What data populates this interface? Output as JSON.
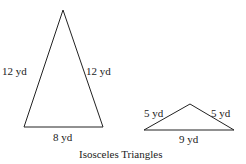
{
  "caption": "Isosceles Triangles",
  "triangles": [
    {
      "name": "tall-triangle",
      "left_side": "12 yd",
      "right_side": "12 yd",
      "base": "8 yd"
    },
    {
      "name": "wide-triangle",
      "left_side": "5 yd",
      "right_side": "5 yd",
      "base": "9 yd"
    }
  ],
  "colors": {
    "stroke": "#222222",
    "background": "#ffffff"
  }
}
